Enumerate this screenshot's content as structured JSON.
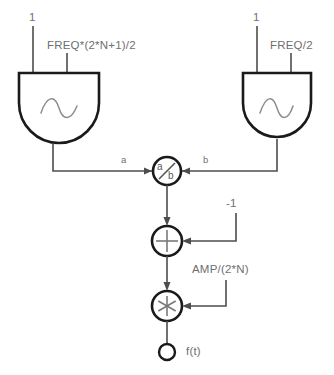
{
  "diagram": {
    "colors": {
      "wire": "#4d4d4d",
      "block_outline": "#1a1a1a",
      "text": "#6f6f6f",
      "wave": "#8c8c8c",
      "background": "#ffffff"
    },
    "blocks": [
      {
        "id": "osc-left",
        "type": "oscillator",
        "icon": "sine-wave-icon",
        "input_left_label": "1",
        "input_right_label": "FREQ*(2*N+1)/2"
      },
      {
        "id": "osc-right",
        "type": "oscillator",
        "icon": "sine-wave-icon",
        "input_left_label": "1",
        "input_right_label": "FREQ/2"
      }
    ],
    "nodes": [
      {
        "id": "divide",
        "type": "divide",
        "glyph": "a/b",
        "numerator_text": "a",
        "denominator_text": "b",
        "port_left_label": "a",
        "port_right_label": "b"
      },
      {
        "id": "sum",
        "type": "sum",
        "glyph": "+",
        "constant_label": "-1"
      },
      {
        "id": "multiply",
        "type": "multiply",
        "glyph": "*",
        "constant_label": "AMP/(2*N)"
      }
    ],
    "output": {
      "id": "output-terminal",
      "label": "f(t)"
    }
  }
}
